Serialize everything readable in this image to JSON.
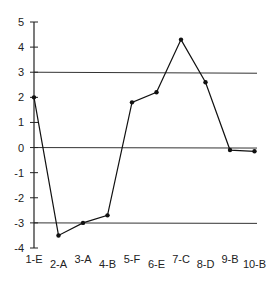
{
  "chart_data": {
    "type": "line",
    "title": "",
    "xlabel": "",
    "ylabel": "",
    "categories": [
      "1-E",
      "2-A",
      "3-A",
      "4-B",
      "5-F",
      "6-E",
      "7-C",
      "8-D",
      "9-B",
      "10-B"
    ],
    "values": [
      2.0,
      -3.5,
      -3.0,
      -2.7,
      1.8,
      2.2,
      4.3,
      2.6,
      -0.1,
      -0.15
    ],
    "ylim": [
      -4,
      5
    ],
    "yticks": [
      5,
      4,
      3,
      2,
      1,
      0,
      -1,
      -2,
      -3,
      -4
    ],
    "reference_lines": [
      3,
      0,
      -3
    ],
    "grid": false,
    "legend": null
  }
}
